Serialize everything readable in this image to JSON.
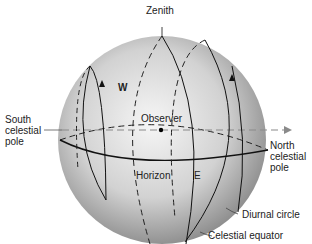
{
  "diagram": {
    "type": "celestial-sphere",
    "labels": {
      "zenith": "Zenith",
      "west": "W",
      "east": "E",
      "observer": "Observer",
      "horizon": "Horizon",
      "south_pole_1": "South",
      "south_pole_2": "celestial",
      "south_pole_3": "pole",
      "north_pole_1": "North",
      "north_pole_2": "celestial",
      "north_pole_3": "pole",
      "diurnal_circle": "Diurnal circle",
      "celestial_equator": "Celestial equator"
    },
    "colors": {
      "sphere_light": "#f4f4f4",
      "sphere_dark": "#8a8a8a",
      "line": "#1a1a1a",
      "axis": "#888888"
    }
  }
}
